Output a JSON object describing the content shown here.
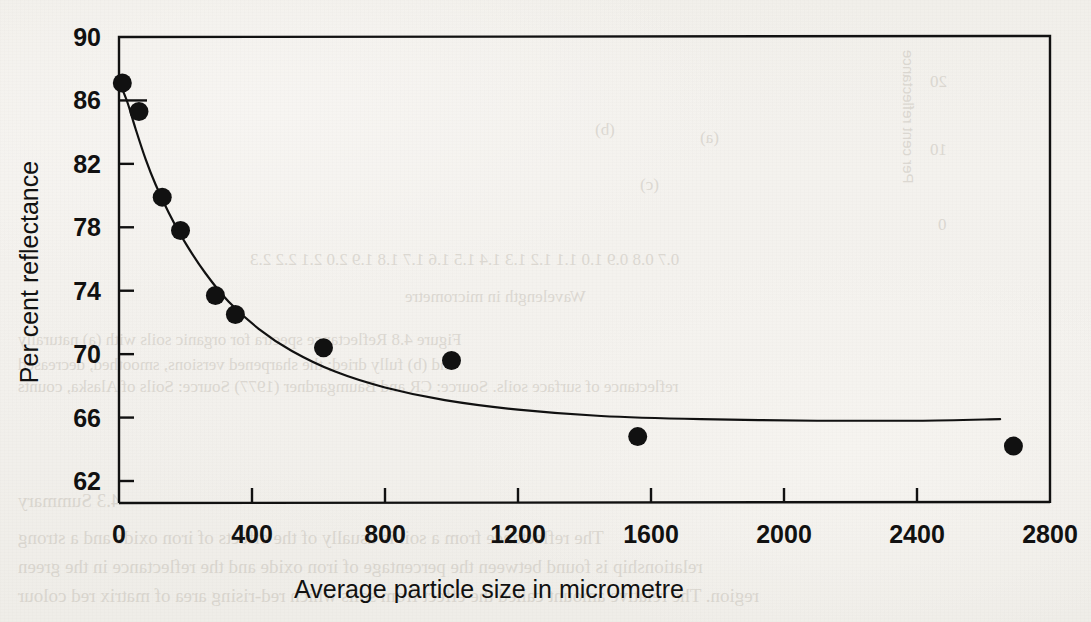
{
  "page": {
    "background_color": "#f3f1ed",
    "ink_color": "#111111"
  },
  "chart_data": {
    "type": "scatter",
    "title": "",
    "subtitle": "",
    "xlabel": "Average particle size in micrometre",
    "ylabel": "Per cent reflectance",
    "xlim": [
      0,
      2800
    ],
    "ylim": [
      60,
      90
    ],
    "xticks": [
      0,
      400,
      800,
      1200,
      1600,
      2000,
      2400,
      2800
    ],
    "yticks": [
      62,
      66,
      70,
      74,
      78,
      82,
      86,
      90
    ],
    "xticklabels": [
      "0",
      "400",
      "800",
      "1200",
      "1600",
      "2000",
      "2400",
      "2800"
    ],
    "yticklabels": [
      "62",
      "66",
      "70",
      "74",
      "78",
      "82",
      "86",
      "90"
    ],
    "grid": false,
    "legend": false,
    "legend_position": "none",
    "marker": "filled-circle",
    "marker_color": "#111111",
    "line_color": "#111111",
    "series": [
      {
        "name": "Measured reflectance",
        "kind": "points",
        "points": [
          {
            "x": 10,
            "y": 87.1
          },
          {
            "x": 60,
            "y": 85.3
          },
          {
            "x": 130,
            "y": 79.9
          },
          {
            "x": 185,
            "y": 77.8
          },
          {
            "x": 290,
            "y": 73.7
          },
          {
            "x": 350,
            "y": 72.5
          },
          {
            "x": 615,
            "y": 70.4
          },
          {
            "x": 1000,
            "y": 69.6
          },
          {
            "x": 1560,
            "y": 64.8
          },
          {
            "x": 2690,
            "y": 64.2
          }
        ]
      },
      {
        "name": "Fitted decay curve",
        "kind": "line",
        "points": [
          {
            "x": 0,
            "y": 87.2
          },
          {
            "x": 25,
            "y": 85.9
          },
          {
            "x": 50,
            "y": 84.2
          },
          {
            "x": 80,
            "y": 82.3
          },
          {
            "x": 110,
            "y": 80.7
          },
          {
            "x": 150,
            "y": 78.9
          },
          {
            "x": 200,
            "y": 77.0
          },
          {
            "x": 260,
            "y": 75.1
          },
          {
            "x": 330,
            "y": 73.3
          },
          {
            "x": 420,
            "y": 71.6
          },
          {
            "x": 520,
            "y": 70.2
          },
          {
            "x": 650,
            "y": 68.9
          },
          {
            "x": 800,
            "y": 67.9
          },
          {
            "x": 980,
            "y": 67.1
          },
          {
            "x": 1200,
            "y": 66.5
          },
          {
            "x": 1450,
            "y": 66.1
          },
          {
            "x": 1750,
            "y": 65.9
          },
          {
            "x": 2100,
            "y": 65.8
          },
          {
            "x": 2400,
            "y": 65.8
          },
          {
            "x": 2650,
            "y": 65.9
          }
        ]
      }
    ]
  },
  "bleed_through": {
    "note": "faint mirrored text showing through from the reverse side of the scanned page",
    "fragments": [
      {
        "text": "Per cent reflectance",
        "x": 900,
        "y": 50,
        "size": 15,
        "vertical": true
      },
      {
        "text": "20",
        "x": 930,
        "y": 72,
        "size": 17
      },
      {
        "text": "10",
        "x": 930,
        "y": 140,
        "size": 17
      },
      {
        "text": "0",
        "x": 938,
        "y": 215,
        "size": 17
      },
      {
        "text": "(a)",
        "x": 700,
        "y": 128,
        "size": 17
      },
      {
        "text": "(b)",
        "x": 595,
        "y": 120,
        "size": 17
      },
      {
        "text": "(c)",
        "x": 640,
        "y": 175,
        "size": 17
      },
      {
        "text": "0.7  0.8  0.9  1.0  1.1  1.2  1.3  1.4  1.5  1.6  1.7  1.8  1.9  2.0  2.1  2.2  2.3",
        "x": 250,
        "y": 250,
        "size": 17
      },
      {
        "text": "Wavelength in micrometre",
        "x": 405,
        "y": 287,
        "size": 17
      },
      {
        "text": "Figure 4.8   Reflectance spectra for organic soils with (a) naturally",
        "x": 18,
        "y": 330,
        "size": 17
      },
      {
        "text": "and (b) fully dried; the sharpened versions, smoothed, decreased",
        "x": 18,
        "y": 355,
        "size": 17
      },
      {
        "text": "reflectance of surface soils. Source: CR and Baumgardner (1977) Source: Soils of Alaska, counts",
        "x": 18,
        "y": 377,
        "size": 17
      },
      {
        "text": "4.3  Summary",
        "x": 18,
        "y": 490,
        "size": 19
      },
      {
        "text": "The reflectance from a soil is usually of the effects of iron oxide and a strong",
        "x": 18,
        "y": 527,
        "size": 19
      },
      {
        "text": "relationship is found between the percentage of iron oxide and the reflectance in the green",
        "x": 18,
        "y": 556,
        "size": 19
      },
      {
        "text": "region. The relative amount called the effect from soils which red-rising area of matrix red colour",
        "x": 18,
        "y": 585,
        "size": 19
      }
    ]
  }
}
